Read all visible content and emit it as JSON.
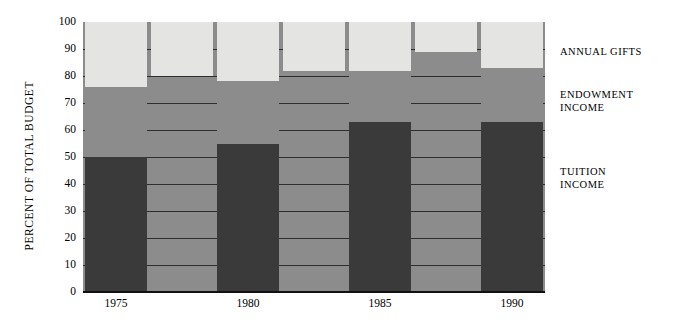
{
  "chart_data": {
    "type": "bar",
    "title": "",
    "subtitle": "",
    "xlabel": "",
    "ylabel": "PERCENT OF TOTAL BUDGET",
    "ylim": [
      0,
      100
    ],
    "grid": true,
    "stacked": true,
    "legend_position": "right",
    "y_ticks": [
      0,
      10,
      20,
      30,
      40,
      50,
      60,
      70,
      80,
      90,
      100
    ],
    "y_tick_labels": [
      "0",
      "10",
      "20",
      "30",
      "40",
      "50",
      "60",
      "70",
      "80",
      "90",
      "100"
    ],
    "categories": [
      "1975",
      "",
      "1980",
      "",
      "1985",
      "",
      "1990"
    ],
    "x_tick_labels": [
      "1975",
      "1980",
      "1985",
      "1990"
    ],
    "series": [
      {
        "name": "TUITION INCOME",
        "color": "#3a3a3a",
        "values": [
          50,
          50,
          55,
          55,
          63,
          63,
          63
        ]
      },
      {
        "name": "ENDOWMENT INCOME",
        "color": "#8c8c8c",
        "values": [
          26,
          30,
          23,
          27,
          19,
          26,
          20
        ]
      },
      {
        "name": "ANNUAL GIFTS",
        "color": "#e4e4e2",
        "values": [
          24,
          20,
          22,
          18,
          18,
          11,
          17
        ]
      }
    ],
    "cumulative_tops": {
      "tuition": [
        50,
        50,
        55,
        55,
        63,
        63,
        63
      ],
      "endowment": [
        76,
        80,
        78,
        82,
        82,
        89,
        83
      ],
      "total": [
        100,
        100,
        100,
        100,
        100,
        100,
        100
      ]
    },
    "annotations": []
  },
  "axis": {
    "y_title": "PERCENT OF TOTAL BUDGET",
    "y_ticks": [
      "100",
      "90",
      "80",
      "70",
      "60",
      "50",
      "40",
      "30",
      "20",
      "10",
      "0"
    ],
    "x_ticks": [
      "1975",
      "1980",
      "1985",
      "1990"
    ]
  },
  "legend": {
    "entries": [
      {
        "label": "ANNUAL GIFTS",
        "color": "#e4e4e2"
      },
      {
        "label": "ENDOWMENT\nINCOME",
        "color": "#8c8c8c"
      },
      {
        "label": "TUITION\nINCOME",
        "color": "#3a3a3a"
      }
    ]
  },
  "colors": {
    "tuition": "#3a3a3a",
    "endowment": "#8c8c8c",
    "annual_gifts": "#e4e4e2",
    "background": "#ffffff",
    "gridline": "#2e2e2e",
    "axis": "#111111"
  }
}
